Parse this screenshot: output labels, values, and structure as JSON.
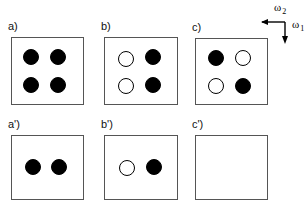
{
  "figure": {
    "background": "#ffffff",
    "box_border_color": "#555555",
    "site_fill_color": "#000000",
    "site_open_color": "#ffffff",
    "panels": [
      {
        "id": "a",
        "label": "a)",
        "box": {
          "x": 11,
          "y": 37,
          "w": 73,
          "h": 68
        },
        "label_pos": {
          "x": 8,
          "y": 21
        },
        "sites": [
          {
            "name": "site-top-left",
            "state": "filled",
            "cx": 31,
            "cy": 57,
            "r": 8
          },
          {
            "name": "site-top-right",
            "state": "filled",
            "cx": 58,
            "cy": 57,
            "r": 8
          },
          {
            "name": "site-bottom-left",
            "state": "filled",
            "cx": 31,
            "cy": 85,
            "r": 8
          },
          {
            "name": "site-bottom-right",
            "state": "filled",
            "cx": 58,
            "cy": 85,
            "r": 8
          }
        ]
      },
      {
        "id": "b",
        "label": "b)",
        "box": {
          "x": 104,
          "y": 37,
          "w": 74,
          "h": 68
        },
        "label_pos": {
          "x": 101,
          "y": 21
        },
        "sites": [
          {
            "name": "site-top-left",
            "state": "open",
            "cx": 126,
            "cy": 59,
            "r": 8
          },
          {
            "name": "site-top-right",
            "state": "filled",
            "cx": 153,
            "cy": 57,
            "r": 8
          },
          {
            "name": "site-bottom-left",
            "state": "open",
            "cx": 126,
            "cy": 86,
            "r": 8
          },
          {
            "name": "site-bottom-right",
            "state": "filled",
            "cx": 153,
            "cy": 85,
            "r": 8
          }
        ]
      },
      {
        "id": "c",
        "label": "c)",
        "box": {
          "x": 195,
          "y": 38,
          "w": 73,
          "h": 67
        },
        "label_pos": {
          "x": 192,
          "y": 22
        },
        "sites": [
          {
            "name": "site-top-left",
            "state": "filled",
            "cx": 216,
            "cy": 58,
            "r": 8
          },
          {
            "name": "site-top-right",
            "state": "open",
            "cx": 243,
            "cy": 58,
            "r": 8
          },
          {
            "name": "site-bottom-left",
            "state": "open",
            "cx": 216,
            "cy": 86,
            "r": 8
          },
          {
            "name": "site-bottom-right",
            "state": "filled",
            "cx": 243,
            "cy": 86,
            "r": 8
          }
        ]
      },
      {
        "id": "a-prime",
        "label": "a')",
        "box": {
          "x": 11,
          "y": 135,
          "w": 73,
          "h": 65
        },
        "label_pos": {
          "x": 8,
          "y": 119
        },
        "sites": [
          {
            "name": "site-mid-left",
            "state": "filled",
            "cx": 33,
            "cy": 167,
            "r": 8
          },
          {
            "name": "site-mid-right",
            "state": "filled",
            "cx": 59,
            "cy": 167,
            "r": 8
          }
        ]
      },
      {
        "id": "b-prime",
        "label": "b')",
        "box": {
          "x": 104,
          "y": 135,
          "w": 74,
          "h": 65
        },
        "label_pos": {
          "x": 101,
          "y": 119
        },
        "sites": [
          {
            "name": "site-mid-left",
            "state": "open",
            "cx": 127,
            "cy": 168,
            "r": 8
          },
          {
            "name": "site-mid-right",
            "state": "filled",
            "cx": 154,
            "cy": 167,
            "r": 8
          }
        ]
      },
      {
        "id": "c-prime",
        "label": "c')",
        "box": {
          "x": 195,
          "y": 135,
          "w": 73,
          "h": 65
        },
        "label_pos": {
          "x": 192,
          "y": 119
        },
        "sites": []
      }
    ],
    "axes": {
      "name": "frequency-axes-indicator",
      "omega2": {
        "label": "ω",
        "subscript": "2",
        "direction": "left"
      },
      "omega1": {
        "label": "ω",
        "subscript": "1",
        "direction": "down"
      }
    }
  }
}
